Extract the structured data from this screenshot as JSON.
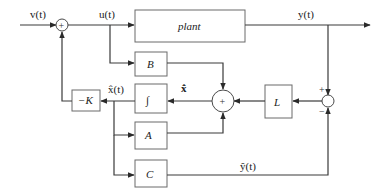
{
  "diagram": {
    "signals": {
      "input": "v(t)",
      "control": "u(t)",
      "output": "y(t)",
      "estimate_state": "x̂(t)",
      "estimate_state_derivative": "x̂̇",
      "estimate_output": "ŷ(t)"
    },
    "blocks": {
      "plant": "plant",
      "B": "B",
      "integrator": "∫",
      "A": "A",
      "C": "C",
      "L": "L",
      "gain": "−K"
    },
    "junctions": {
      "input_sum": "+",
      "observer_sum": "+",
      "error_plus": "+",
      "error_minus": "−"
    }
  }
}
